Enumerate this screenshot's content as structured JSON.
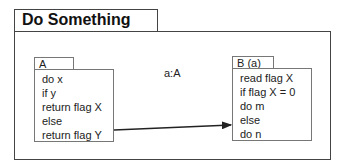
{
  "frame": {
    "title": "Do Something"
  },
  "objectA": {
    "name": "A",
    "lines": [
      "do x",
      "if y",
      "return flag X",
      "else",
      "return flag Y"
    ]
  },
  "objectB": {
    "name": "B (a)",
    "lines": [
      "read flag X",
      "if flag X = 0",
      "do m",
      "else",
      "do n"
    ]
  },
  "connector": {
    "label": "a:A"
  }
}
